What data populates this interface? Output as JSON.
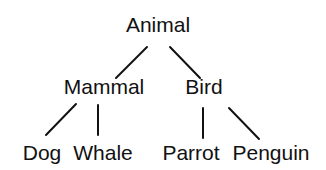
{
  "diagram": {
    "type": "tree",
    "line_color": "#111111",
    "text_color": "#111111",
    "nodes": {
      "animal": {
        "label": "Animal",
        "x": 158,
        "y": 14
      },
      "mammal": {
        "label": "Mammal",
        "x": 104,
        "y": 76
      },
      "bird": {
        "label": "Bird",
        "x": 204,
        "y": 76
      },
      "dog": {
        "label": "Dog",
        "x": 42,
        "y": 142
      },
      "whale": {
        "label": "Whale",
        "x": 103,
        "y": 142
      },
      "parrot": {
        "label": "Parrot",
        "x": 191,
        "y": 142
      },
      "penguin": {
        "label": "Penguin",
        "x": 271,
        "y": 142
      }
    },
    "edges": [
      {
        "from": "Animal",
        "to": "Mammal"
      },
      {
        "from": "Animal",
        "to": "Bird"
      },
      {
        "from": "Mammal",
        "to": "Dog"
      },
      {
        "from": "Mammal",
        "to": "Whale"
      },
      {
        "from": "Bird",
        "to": "Parrot"
      },
      {
        "from": "Bird",
        "to": "Penguin"
      }
    ]
  }
}
